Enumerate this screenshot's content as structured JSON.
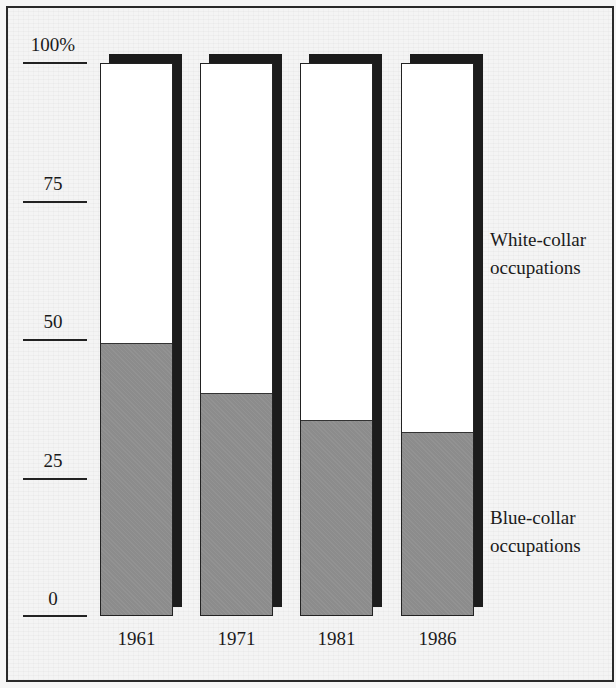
{
  "chart_data": {
    "type": "bar",
    "stacked": true,
    "title": "",
    "xlabel": "",
    "ylabel": "",
    "ylim": [
      0,
      100
    ],
    "y_ticks": [
      "0",
      "25",
      "50",
      "75",
      "100%"
    ],
    "y_tick_values": [
      0,
      25,
      50,
      75,
      100
    ],
    "categories": [
      "1961",
      "1971",
      "1981",
      "1986"
    ],
    "series": [
      {
        "name": "Blue-collar occupations",
        "values": [
          49,
          40,
          35,
          33
        ],
        "color": "#8c8c8c"
      },
      {
        "name": "White-collar occupations",
        "values": [
          51,
          60,
          65,
          67
        ],
        "color": "#ffffff"
      }
    ],
    "legend": {
      "position": "right, inline labels",
      "entries": [
        "White-collar occupations",
        "Blue-collar occupations"
      ]
    },
    "grid": false,
    "style": "3D drop-shadow bars"
  },
  "axis": {
    "ticks": [
      {
        "label": "100%",
        "value": 100
      },
      {
        "label": "75",
        "value": 75
      },
      {
        "label": "50",
        "value": 50
      },
      {
        "label": "25",
        "value": 25
      },
      {
        "label": "0",
        "value": 0
      }
    ]
  },
  "labels": {
    "white_line1": "White-collar",
    "white_line2": "occupations",
    "blue_line1": "Blue-collar",
    "blue_line2": "occupations"
  }
}
